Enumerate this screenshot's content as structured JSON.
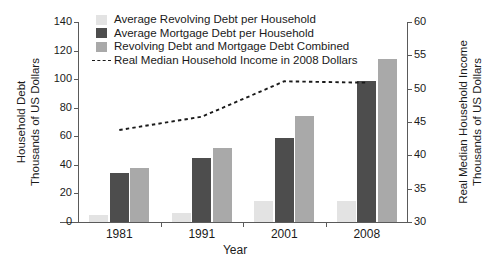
{
  "chart_data": {
    "type": "bar",
    "title": "",
    "subtitle": "",
    "xlabel": "Year",
    "ylabel": "Household Debt Thousands of US Dollars",
    "y2label": "Real Median Household Income Thousands of US Dollars",
    "categories": [
      "1981",
      "1991",
      "2001",
      "2008"
    ],
    "ylim": [
      0,
      140
    ],
    "yticks": [
      0,
      20,
      40,
      60,
      80,
      100,
      120,
      140
    ],
    "y2lim": [
      30,
      60
    ],
    "y2ticks": [
      30,
      35,
      40,
      45,
      50,
      55,
      60
    ],
    "grid": false,
    "legend_position": "top-center",
    "series": [
      {
        "name": "Average Revolving Debt per Household",
        "type": "bar",
        "axis": "left",
        "color": "#e3e3e3",
        "values": [
          5,
          6.5,
          15,
          14.5
        ]
      },
      {
        "name": "Average Mortgage Debt per Household",
        "type": "bar",
        "axis": "left",
        "color": "#4d4d4d",
        "values": [
          34,
          45,
          59,
          99
        ]
      },
      {
        "name": "Revolving Debt and Mortgage Debt Combined",
        "type": "bar",
        "axis": "left",
        "color": "#a9a9a9",
        "values": [
          37.5,
          52,
          74.5,
          114
        ]
      },
      {
        "name": "Real Median Household Income in 2008 Dollars",
        "type": "line",
        "axis": "right",
        "color": "#1a1a1a",
        "style": "dashed",
        "values": [
          43.8,
          45.8,
          51.1,
          50.9
        ]
      }
    ]
  },
  "axes": {
    "left": {
      "title_line1": "Household Debt",
      "title_line2": "Thousands of US Dollars",
      "tick_labels": [
        "0",
        "20",
        "40",
        "60",
        "80",
        "100",
        "120",
        "140"
      ]
    },
    "right": {
      "title_line1": "Real Median Household Income",
      "title_line2": "Thousands of US Dollars",
      "tick_labels": [
        "30",
        "35",
        "40",
        "45",
        "50",
        "55",
        "60"
      ]
    },
    "x": {
      "title": "Year",
      "tick_labels": [
        "1981",
        "1991",
        "2001",
        "2008"
      ]
    }
  },
  "legend": {
    "items": [
      {
        "label": "Average Revolving Debt per Household",
        "color": "#e3e3e3",
        "marker": "swatch"
      },
      {
        "label": "Average Mortgage Debt per Household",
        "color": "#4d4d4d",
        "marker": "swatch"
      },
      {
        "label": "Revolving Debt and Mortgage Debt Combined",
        "color": "#a9a9a9",
        "marker": "swatch"
      },
      {
        "label": "Real Median Household Income in 2008 Dollars",
        "color": "#1a1a1a",
        "marker": "dashed-line"
      }
    ]
  }
}
